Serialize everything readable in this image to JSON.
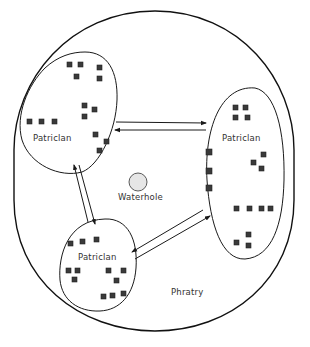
{
  "diagram": {
    "outer_group_label": "Phratry",
    "center_feature_label": "Waterhole",
    "colors": {
      "stroke": "#1a1a1a",
      "member_fill": "#3a3a3a",
      "waterhole_fill": "#e6e6e6",
      "background": "#ffffff"
    },
    "clans": [
      {
        "id": "clan-top-left",
        "label": "Patriclan",
        "member_count": 14
      },
      {
        "id": "clan-right",
        "label": "Patriclan",
        "member_count": 17
      },
      {
        "id": "clan-bottom",
        "label": "Patriclan",
        "member_count": 12
      }
    ],
    "exchanges": [
      {
        "from": "clan-top-left",
        "to": "clan-right",
        "direction": "bidirectional"
      },
      {
        "from": "clan-top-left",
        "to": "clan-bottom",
        "direction": "bidirectional"
      },
      {
        "from": "clan-bottom",
        "to": "clan-right",
        "direction": "bidirectional"
      }
    ]
  }
}
